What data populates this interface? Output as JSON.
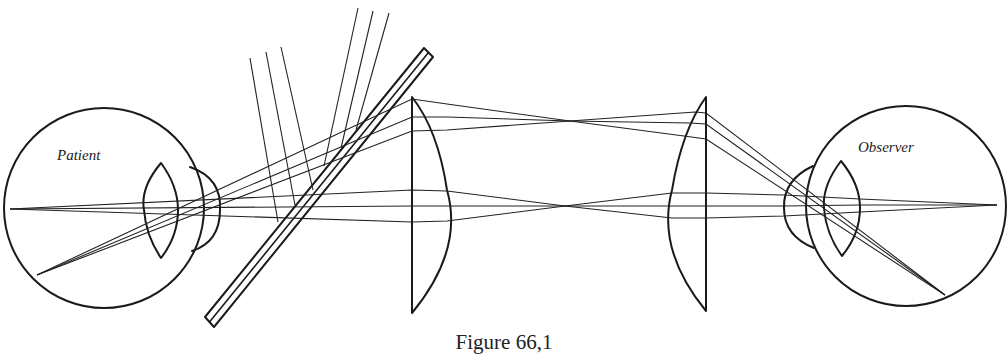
{
  "figure": {
    "caption": "Figure 66,1",
    "labels": {
      "patient": "Patient",
      "observer": "Observer"
    },
    "components": [
      {
        "name": "patient-eye",
        "type": "eyeball",
        "center": [
          104,
          208
        ],
        "radius": 100
      },
      {
        "name": "patient-lens",
        "type": "biconvex-lens"
      },
      {
        "name": "patient-cornea",
        "type": "cornea"
      },
      {
        "name": "beam-splitter-plate",
        "type": "glass-plate"
      },
      {
        "name": "left-condensing-lens",
        "type": "plano-convex-lens"
      },
      {
        "name": "right-condensing-lens",
        "type": "plano-convex-lens"
      },
      {
        "name": "observer-cornea",
        "type": "cornea"
      },
      {
        "name": "observer-lens",
        "type": "biconvex-lens"
      },
      {
        "name": "observer-eye",
        "type": "eyeball",
        "center": [
          906,
          206
        ],
        "radius": 100
      }
    ],
    "colors": {
      "line": "#1a1a1a",
      "background": "#ffffff"
    }
  }
}
